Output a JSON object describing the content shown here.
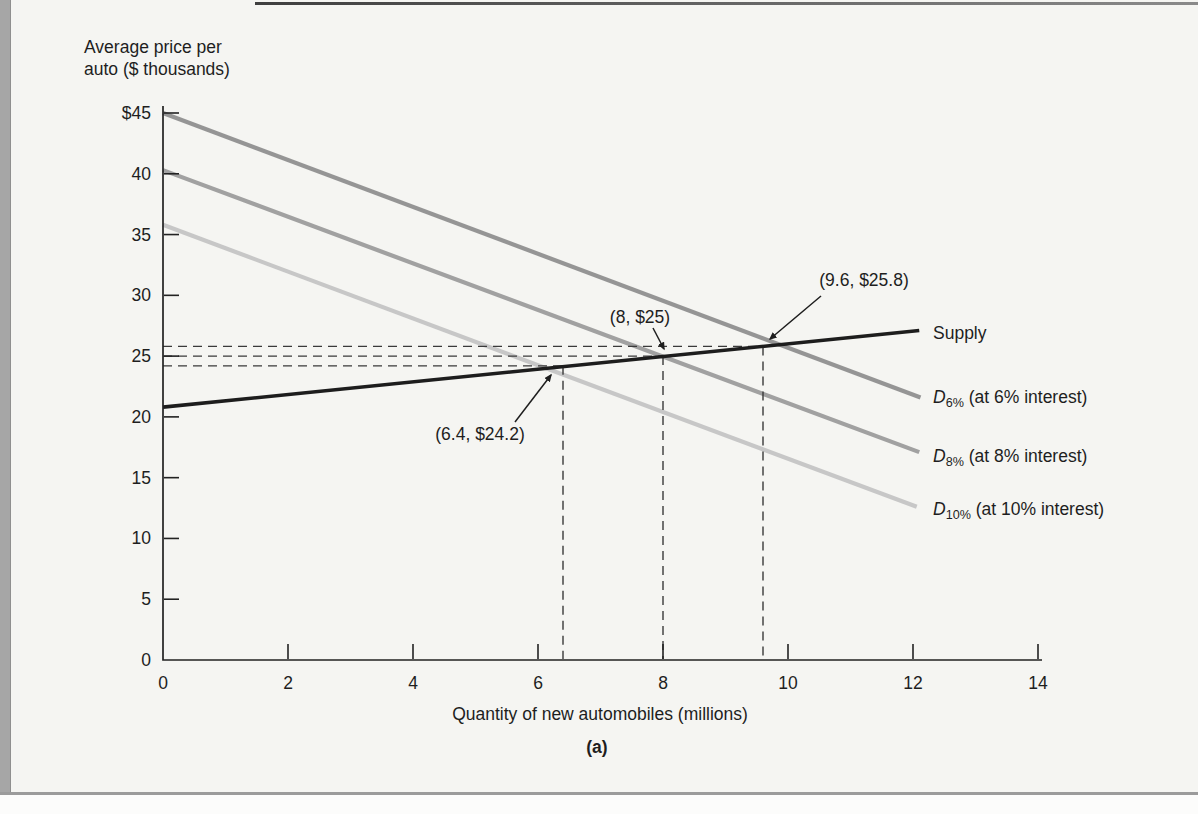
{
  "labels": {
    "ylabel_line1": "Average price per",
    "ylabel_line2": "auto ($ thousands)",
    "xlabel": "Quantity of new automobiles (millions)",
    "panel": "(a)"
  },
  "curve_labels": {
    "supply": "Supply",
    "d6": {
      "d": "D",
      "sub": "6%",
      "rest": " (at 6% interest)"
    },
    "d8": {
      "d": "D",
      "sub": "8%",
      "rest": " (at 8% interest)"
    },
    "d10": {
      "d": "D",
      "sub": "10%",
      "rest": " (at 10% interest)"
    }
  },
  "chart_data": {
    "type": "line",
    "title": "",
    "xlabel": "Quantity of new automobiles (millions)",
    "ylabel": "Average price per auto ($ thousands)",
    "panel": "(a)",
    "xlim": [
      0,
      14
    ],
    "ylim": [
      0,
      45
    ],
    "grid": false,
    "x_ticks": [
      0,
      2,
      4,
      6,
      8,
      10,
      12,
      14
    ],
    "x_tick_labels": [
      "0",
      "2",
      "4",
      "6",
      "8",
      "10",
      "12",
      "14"
    ],
    "y_ticks": [
      0,
      5,
      10,
      15,
      20,
      25,
      30,
      35,
      40,
      45
    ],
    "y_tick_labels": [
      "0",
      "5",
      "10",
      "15",
      "20",
      "25",
      "30",
      "35",
      "40",
      "$45"
    ],
    "series": [
      {
        "name": "D10% demand (at 10% interest)",
        "color": "#c7c7c7",
        "stroke_width": 4.2,
        "points": [
          [
            0,
            35.8
          ],
          [
            12.06,
            12.6
          ]
        ]
      },
      {
        "name": "D8% demand (at 8% interest)",
        "color": "#a1a1a1",
        "stroke_width": 4.2,
        "points": [
          [
            0,
            40.3
          ],
          [
            12.1,
            17.1
          ]
        ]
      },
      {
        "name": "D6% demand (at 6% interest)",
        "color": "#959595",
        "stroke_width": 4.2,
        "points": [
          [
            0,
            45.0
          ],
          [
            12.12,
            21.6
          ]
        ]
      },
      {
        "name": "Supply",
        "color": "#1d1d1d",
        "stroke_width": 3.6,
        "points": [
          [
            0,
            20.8
          ],
          [
            12.1,
            27.1
          ]
        ]
      }
    ],
    "equilibria": [
      {
        "label": "(6.4, $24.2)",
        "x": 6.4,
        "y": 24.2
      },
      {
        "label": "(8, $25)",
        "x": 8,
        "y": 25
      },
      {
        "label": "(9.6, $25.8)",
        "x": 9.6,
        "y": 25.8
      }
    ],
    "annotation_arrows_px": [
      {
        "tail": [
          515,
          422
        ],
        "head": [
          551,
          375
        ]
      },
      {
        "tail": [
          653,
          328
        ],
        "head": [
          664,
          349
        ]
      },
      {
        "tail": [
          821,
          296
        ],
        "head": [
          770,
          339
        ]
      }
    ],
    "axis_color": "#222222",
    "guide_color": "#3a3a3a"
  }
}
